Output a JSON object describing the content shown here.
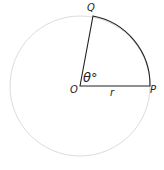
{
  "diagram": {
    "type": "circle-sector",
    "labels": {
      "center": "O",
      "point_p": "P",
      "point_q": "Q",
      "radius": "r",
      "angle": "θ°"
    },
    "colors": {
      "circle": "#d8d8d8",
      "sector": "#222222"
    }
  }
}
